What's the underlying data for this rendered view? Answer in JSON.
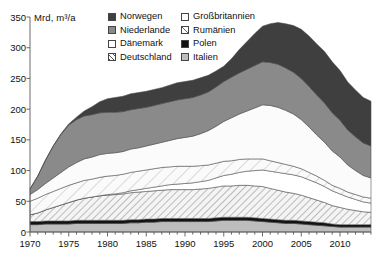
{
  "axis": {
    "unit_label": "Mrd, m³/a",
    "y_ticks": [
      "350",
      "300",
      "250",
      "200",
      "150",
      "100",
      "50",
      "0"
    ],
    "x_ticks": [
      "1970",
      "1975",
      "1980",
      "1985",
      "1990",
      "1995",
      "2000",
      "2005",
      "2010"
    ]
  },
  "legend": {
    "items": [
      {
        "label": "Norwegen",
        "swatch": "dark-gray-solid",
        "color": "#3f3f3f"
      },
      {
        "label": "Niederlande",
        "swatch": "medium-gray-solid",
        "color": "#8a8a8a"
      },
      {
        "label": "Dänemark",
        "swatch": "white-solid",
        "color": "#ffffff"
      },
      {
        "label": "Deutschland",
        "swatch": "diagonal-hatch",
        "color": "#f2f2f2"
      },
      {
        "label": "Großbritannien",
        "swatch": "very-light-solid",
        "color": "#fbfbfb"
      },
      {
        "label": "Rumänien",
        "swatch": "fine-diagonal-hatch",
        "color": "#f7f7f7"
      },
      {
        "label": "Polen",
        "swatch": "black-solid",
        "color": "#121212"
      },
      {
        "label": "Italien",
        "swatch": "light-gray-solid",
        "color": "#bdbdbd"
      }
    ]
  },
  "chart_data": {
    "type": "area",
    "stacked": true,
    "title": "",
    "subtitle": "",
    "xlabel": "",
    "ylabel": "Mrd, m³/a",
    "ylim": [
      0,
      350
    ],
    "xlim": [
      1970,
      2014
    ],
    "grid": false,
    "legend_position": "top",
    "y_tick_values": [
      0,
      50,
      100,
      150,
      200,
      250,
      300,
      350
    ],
    "x_tick_values": [
      1970,
      1975,
      1980,
      1985,
      1990,
      1995,
      2000,
      2005,
      2010
    ],
    "x": [
      1970,
      1971,
      1972,
      1973,
      1974,
      1975,
      1976,
      1977,
      1978,
      1979,
      1980,
      1981,
      1982,
      1983,
      1984,
      1985,
      1986,
      1987,
      1988,
      1989,
      1990,
      1991,
      1992,
      1993,
      1994,
      1995,
      1996,
      1997,
      1998,
      1999,
      2000,
      2001,
      2002,
      2003,
      2004,
      2005,
      2006,
      2007,
      2008,
      2009,
      2010,
      2011,
      2012,
      2013,
      2014
    ],
    "series": [
      {
        "name": "Italien",
        "color": "#bdbdbd",
        "pattern": "solid",
        "values": [
          12,
          12,
          13,
          13,
          13,
          13,
          14,
          14,
          14,
          14,
          14,
          14,
          14,
          15,
          15,
          16,
          16,
          17,
          17,
          17,
          17,
          17,
          17,
          17,
          18,
          19,
          19,
          19,
          19,
          18,
          17,
          16,
          15,
          14,
          14,
          13,
          12,
          11,
          10,
          9,
          8,
          8,
          8,
          8,
          8
        ]
      },
      {
        "name": "Polen",
        "color": "#121212",
        "pattern": "solid",
        "values": [
          5,
          5,
          5,
          5,
          5,
          5,
          5,
          5,
          5,
          5,
          5,
          5,
          5,
          5,
          5,
          5,
          5,
          5,
          5,
          5,
          5,
          5,
          5,
          5,
          5,
          5,
          5,
          5,
          5,
          5,
          5,
          5,
          5,
          5,
          5,
          5,
          5,
          5,
          5,
          4,
          4,
          4,
          4,
          4,
          4
        ]
      },
      {
        "name": "Deutschland",
        "color": "#f2f2f2",
        "pattern": "diagonal-hatch",
        "values": [
          11,
          14,
          18,
          22,
          26,
          30,
          33,
          36,
          38,
          40,
          41,
          42,
          43,
          44,
          45,
          45,
          46,
          46,
          47,
          47,
          47,
          47,
          48,
          49,
          50,
          51,
          51,
          52,
          52,
          52,
          52,
          50,
          48,
          46,
          44,
          42,
          39,
          36,
          33,
          30,
          28,
          25,
          23,
          21,
          20
        ]
      },
      {
        "name": "Dänemark",
        "color": "#ffffff",
        "pattern": "solid",
        "values": [
          0,
          0,
          0,
          0,
          0,
          0,
          0,
          0,
          0,
          0,
          1,
          1,
          2,
          3,
          4,
          5,
          6,
          7,
          8,
          9,
          10,
          11,
          12,
          13,
          15,
          17,
          19,
          21,
          23,
          25,
          27,
          28,
          29,
          30,
          30,
          30,
          29,
          28,
          26,
          24,
          22,
          20,
          18,
          16,
          15
        ]
      },
      {
        "name": "Rumänien",
        "color": "#f7f7f7",
        "pattern": "fine-diagonal-hatch",
        "values": [
          22,
          24,
          25,
          26,
          27,
          28,
          28,
          29,
          29,
          30,
          30,
          30,
          30,
          30,
          30,
          30,
          30,
          30,
          29,
          29,
          28,
          27,
          26,
          25,
          24,
          23,
          22,
          21,
          20,
          19,
          18,
          17,
          16,
          15,
          14,
          13,
          12,
          11,
          10,
          9,
          9,
          8,
          8,
          8,
          8
        ]
      },
      {
        "name": "Großbritannien",
        "color": "#fbfbfb",
        "pattern": "solid",
        "values": [
          11,
          14,
          18,
          22,
          26,
          30,
          33,
          35,
          36,
          37,
          37,
          37,
          37,
          38,
          38,
          39,
          40,
          41,
          43,
          45,
          47,
          49,
          52,
          56,
          60,
          65,
          70,
          74,
          78,
          83,
          88,
          90,
          90,
          88,
          85,
          80,
          74,
          67,
          62,
          56,
          51,
          44,
          39,
          35,
          33
        ]
      },
      {
        "name": "Niederlande",
        "color": "#8a8a8a",
        "pattern": "solid",
        "values": [
          9,
          22,
          38,
          52,
          62,
          68,
          70,
          70,
          69,
          68,
          67,
          66,
          65,
          64,
          64,
          63,
          63,
          63,
          63,
          63,
          63,
          63,
          63,
          63,
          64,
          65,
          66,
          67,
          68,
          69,
          70,
          70,
          70,
          69,
          68,
          67,
          66,
          65,
          64,
          62,
          60,
          57,
          55,
          53,
          52
        ]
      },
      {
        "name": "Norwegen",
        "color": "#3f3f3f",
        "pattern": "solid",
        "values": [
          0,
          0,
          0,
          0,
          1,
          2,
          4,
          8,
          13,
          18,
          22,
          24,
          25,
          26,
          26,
          26,
          26,
          26,
          27,
          28,
          28,
          28,
          28,
          27,
          26,
          25,
          30,
          38,
          45,
          52,
          58,
          63,
          68,
          72,
          76,
          80,
          82,
          83,
          84,
          83,
          81,
          78,
          76,
          74,
          73
        ]
      }
    ]
  }
}
